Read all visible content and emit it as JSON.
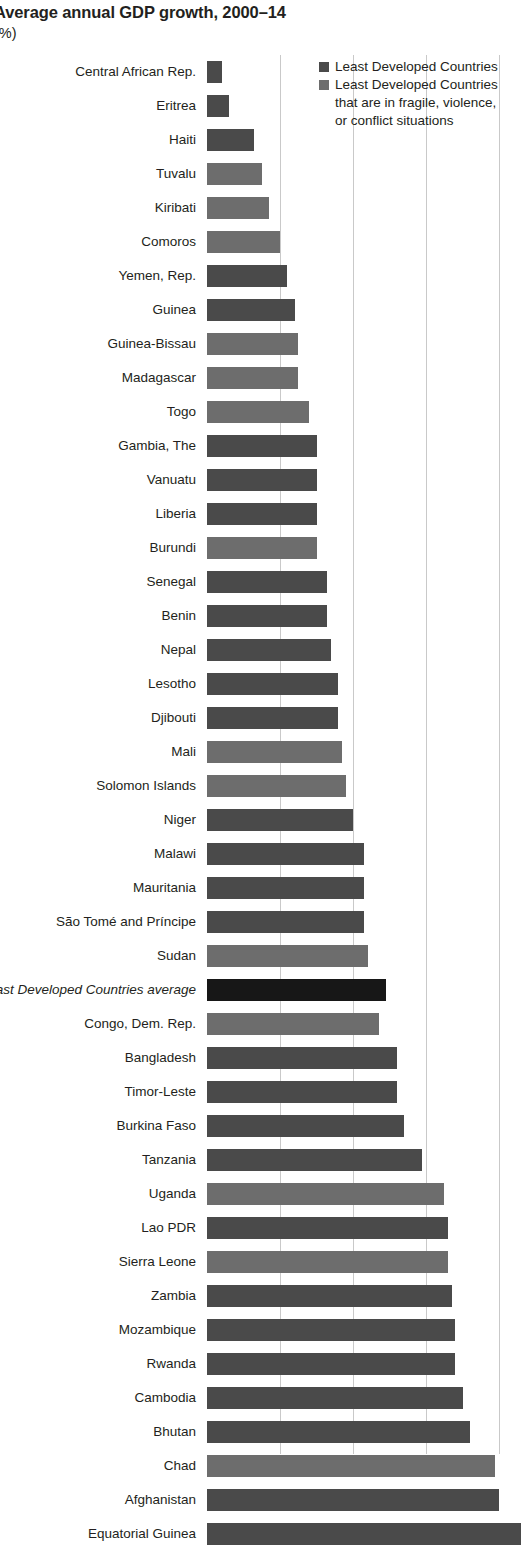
{
  "header": {
    "title": "Average annual GDP growth, 2000–14",
    "subtitle": "(%)"
  },
  "legend": {
    "position": "top-right",
    "items": [
      {
        "label": "Least Developed Countries",
        "color": "#4a4a4a",
        "swatch": "legend-swatch-dark"
      },
      {
        "label": "Least Developed Countries",
        "line2": "that are in fragile, violence,",
        "line3": "or conflict situations",
        "color": "#6d6d6d",
        "swatch": "legend-swatch-gray"
      }
    ]
  },
  "colors": {
    "bar_ldc": "#6d6d6d",
    "bar_fragile": "#4a4a4a",
    "bar_average": "#171717",
    "gridline": "#c9c9c9",
    "text": "#231f20"
  },
  "chart_data": {
    "type": "bar",
    "orientation": "horizontal",
    "title": "Average annual GDP growth, 2000–14",
    "subtitle": "(%)",
    "xlabel": "",
    "ylabel": "",
    "xlim": [
      0,
      8.6
    ],
    "gridlines_at": [
      2,
      4,
      6,
      8
    ],
    "grid": true,
    "axis_tick_labels_visible": false,
    "note": "Chart is cropped at bottom edge; x-axis tick labels are not visible in the screenshot.",
    "series_legend": {
      "fragile": "Least Developed Countries that are in fragile, violence, or conflict situations",
      "ldc": "Least Developed Countries",
      "average": "Least Developed Countries average"
    },
    "categories": [
      "Central African Rep.",
      "Eritrea",
      "Haiti",
      "Tuvalu",
      "Kiribati",
      "Comoros",
      "Yemen, Rep.",
      "Guinea",
      "Guinea-Bissau",
      "Madagascar",
      "Togo",
      "Gambia, The",
      "Vanuatu",
      "Liberia",
      "Burundi",
      "Senegal",
      "Benin",
      "Nepal",
      "Lesotho",
      "Djibouti",
      "Mali",
      "Solomon Islands",
      "Niger",
      "Malawi",
      "Mauritania",
      "São Tomé and Príncipe",
      "Sudan",
      "Least Developed Countries average",
      "Congo, Dem. Rep.",
      "Bangladesh",
      "Timor-Leste",
      "Burkina Faso",
      "Tanzania",
      "Uganda",
      "Lao PDR",
      "Sierra Leone",
      "Zambia",
      "Mozambique",
      "Rwanda",
      "Cambodia",
      "Bhutan",
      "Chad",
      "Afghanistan",
      "Equatorial Guinea"
    ],
    "values": [
      0.4,
      0.6,
      1.3,
      1.5,
      1.7,
      2.0,
      2.2,
      2.4,
      2.5,
      2.5,
      2.8,
      3.0,
      3.0,
      3.0,
      3.0,
      3.3,
      3.3,
      3.4,
      3.6,
      3.6,
      3.7,
      3.8,
      4.0,
      4.3,
      4.3,
      4.3,
      4.4,
      4.9,
      4.7,
      5.2,
      5.2,
      5.4,
      5.9,
      6.5,
      6.6,
      6.6,
      6.7,
      6.8,
      6.8,
      7.0,
      7.2,
      7.9,
      8.0,
      8.6
    ],
    "groups": [
      "fragile",
      "fragile",
      "fragile",
      "ldc",
      "ldc",
      "ldc",
      "fragile",
      "fragile",
      "ldc",
      "ldc",
      "ldc",
      "fragile",
      "fragile",
      "fragile",
      "ldc",
      "fragile",
      "fragile",
      "fragile",
      "fragile",
      "fragile",
      "ldc",
      "ldc",
      "fragile",
      "fragile",
      "fragile",
      "fragile",
      "ldc",
      "average",
      "ldc",
      "fragile",
      "fragile",
      "fragile",
      "fragile",
      "ldc",
      "fragile",
      "ldc",
      "fragile",
      "fragile",
      "fragile",
      "fragile",
      "fragile",
      "ldc",
      "fragile",
      "fragile"
    ]
  }
}
